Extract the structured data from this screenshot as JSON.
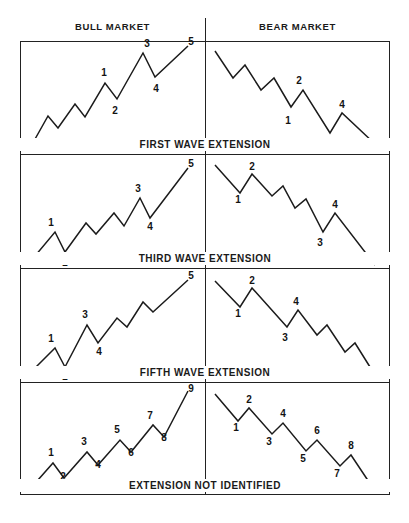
{
  "figure": {
    "title_columns": [
      "BULL MARKET",
      "BEAR MARKET"
    ],
    "header_bull": "BULL MARKET",
    "header_bear": "BEAR MARKET",
    "stroke_color": "#1b1b1b",
    "border_color": "#222222",
    "background": "#ffffff",
    "captions": [
      "FIRST WAVE EXTENSION",
      "THIRD WAVE EXTENSION",
      "FIFTH WAVE EXTENSION",
      "EXTENSION NOT IDENTIFIED"
    ]
  },
  "chart_data": {
    "type": "line",
    "title": "",
    "subtitle": "",
    "xlabel": "",
    "ylabel": "",
    "grid": false,
    "legend": "none",
    "axis_visible": false,
    "panels": [
      {
        "row": 1,
        "column": "bull",
        "caption": "FIRST WAVE EXTENSION",
        "direction": "up",
        "points": [
          [
            30,
            148
          ],
          [
            48,
            116
          ],
          [
            58,
            128
          ],
          [
            75,
            104
          ],
          [
            85,
            117
          ],
          [
            105,
            83
          ],
          [
            117,
            99
          ],
          [
            143,
            53
          ],
          [
            155,
            77
          ],
          [
            188,
            46
          ]
        ],
        "labels": [
          {
            "text": "1",
            "x": 104,
            "y": 76
          },
          {
            "text": "2",
            "x": 115,
            "y": 114
          },
          {
            "text": "3",
            "x": 147,
            "y": 47
          },
          {
            "text": "4",
            "x": 156,
            "y": 92
          },
          {
            "text": "5",
            "x": 191,
            "y": 45
          }
        ]
      },
      {
        "row": 1,
        "column": "bear",
        "caption": "FIRST WAVE EXTENSION",
        "direction": "down",
        "points": [
          [
            215,
            51
          ],
          [
            233,
            78
          ],
          [
            245,
            65
          ],
          [
            261,
            90
          ],
          [
            274,
            78
          ],
          [
            291,
            107
          ],
          [
            303,
            90
          ],
          [
            330,
            133
          ],
          [
            342,
            113
          ],
          [
            375,
            144
          ]
        ],
        "labels": [
          {
            "text": "2",
            "x": 299,
            "y": 84
          },
          {
            "text": "1",
            "x": 288,
            "y": 124
          },
          {
            "text": "4",
            "x": 342,
            "y": 108
          },
          {
            "text": "3",
            "x": 327,
            "y": 146
          },
          {
            "text": "5",
            "x": 378,
            "y": 146
          }
        ]
      },
      {
        "row": 2,
        "column": "bull",
        "caption": "THIRD WAVE EXTENSION",
        "direction": "up",
        "points": [
          [
            30,
            262
          ],
          [
            55,
            232
          ],
          [
            65,
            252
          ],
          [
            86,
            223
          ],
          [
            96,
            234
          ],
          [
            114,
            213
          ],
          [
            124,
            226
          ],
          [
            140,
            198
          ],
          [
            150,
            218
          ],
          [
            188,
            168
          ]
        ],
        "labels": [
          {
            "text": "1",
            "x": 51,
            "y": 226
          },
          {
            "text": "2",
            "x": 65,
            "y": 266
          },
          {
            "text": "3",
            "x": 138,
            "y": 192
          },
          {
            "text": "4",
            "x": 150,
            "y": 230
          },
          {
            "text": "5",
            "x": 191,
            "y": 167
          }
        ]
      },
      {
        "row": 2,
        "column": "bear",
        "caption": "THIRD WAVE EXTENSION",
        "direction": "down",
        "points": [
          [
            215,
            165
          ],
          [
            240,
            193
          ],
          [
            252,
            174
          ],
          [
            272,
            196
          ],
          [
            283,
            186
          ],
          [
            295,
            208
          ],
          [
            306,
            199
          ],
          [
            323,
            232
          ],
          [
            335,
            213
          ],
          [
            375,
            265
          ]
        ],
        "labels": [
          {
            "text": "2",
            "x": 252,
            "y": 170
          },
          {
            "text": "1",
            "x": 238,
            "y": 203
          },
          {
            "text": "4",
            "x": 335,
            "y": 208
          },
          {
            "text": "3",
            "x": 320,
            "y": 246
          },
          {
            "text": "5",
            "x": 378,
            "y": 265
          }
        ]
      },
      {
        "row": 3,
        "column": "bull",
        "caption": "FIFTH WAVE EXTENSION",
        "direction": "up",
        "points": [
          [
            30,
            373
          ],
          [
            55,
            348
          ],
          [
            65,
            367
          ],
          [
            87,
            325
          ],
          [
            98,
            343
          ],
          [
            117,
            318
          ],
          [
            127,
            327
          ],
          [
            143,
            302
          ],
          [
            153,
            312
          ],
          [
            188,
            280
          ]
        ],
        "labels": [
          {
            "text": "1",
            "x": 51,
            "y": 342
          },
          {
            "text": "2",
            "x": 65,
            "y": 380
          },
          {
            "text": "3",
            "x": 85,
            "y": 318
          },
          {
            "text": "4",
            "x": 99,
            "y": 355
          },
          {
            "text": "5",
            "x": 191,
            "y": 279
          }
        ]
      },
      {
        "row": 3,
        "column": "bear",
        "caption": "FIFTH WAVE EXTENSION",
        "direction": "down",
        "points": [
          [
            215,
            281
          ],
          [
            240,
            307
          ],
          [
            252,
            288
          ],
          [
            287,
            327
          ],
          [
            298,
            310
          ],
          [
            317,
            335
          ],
          [
            327,
            325
          ],
          [
            345,
            352
          ],
          [
            355,
            343
          ],
          [
            375,
            375
          ]
        ],
        "labels": [
          {
            "text": "2",
            "x": 252,
            "y": 284
          },
          {
            "text": "1",
            "x": 238,
            "y": 317
          },
          {
            "text": "4",
            "x": 296,
            "y": 305
          },
          {
            "text": "3",
            "x": 285,
            "y": 341
          },
          {
            "text": "5",
            "x": 378,
            "y": 376
          }
        ]
      },
      {
        "row": 4,
        "column": "bull",
        "caption": "EXTENSION NOT IDENTIFIED",
        "direction": "up",
        "points": [
          [
            30,
            489
          ],
          [
            53,
            463
          ],
          [
            64,
            478
          ],
          [
            87,
            452
          ],
          [
            98,
            465
          ],
          [
            120,
            440
          ],
          [
            131,
            452
          ],
          [
            153,
            425
          ],
          [
            164,
            437
          ],
          [
            188,
            391
          ]
        ],
        "labels": [
          {
            "text": "1",
            "x": 51,
            "y": 456
          },
          {
            "text": "2",
            "x": 63,
            "y": 480
          },
          {
            "text": "3",
            "x": 84,
            "y": 445
          },
          {
            "text": "4",
            "x": 98,
            "y": 468
          },
          {
            "text": "5",
            "x": 117,
            "y": 433
          },
          {
            "text": "6",
            "x": 131,
            "y": 456
          },
          {
            "text": "7",
            "x": 150,
            "y": 419
          },
          {
            "text": "8",
            "x": 164,
            "y": 441
          },
          {
            "text": "9",
            "x": 191,
            "y": 392
          }
        ]
      },
      {
        "row": 4,
        "column": "bear",
        "caption": "EXTENSION NOT IDENTIFIED",
        "direction": "down",
        "points": [
          [
            215,
            394
          ],
          [
            238,
            421
          ],
          [
            249,
            408
          ],
          [
            272,
            434
          ],
          [
            283,
            423
          ],
          [
            306,
            451
          ],
          [
            317,
            440
          ],
          [
            340,
            466
          ],
          [
            351,
            455
          ],
          [
            375,
            491
          ]
        ],
        "labels": [
          {
            "text": "2",
            "x": 249,
            "y": 403
          },
          {
            "text": "1",
            "x": 236,
            "y": 431
          },
          {
            "text": "4",
            "x": 283,
            "y": 417
          },
          {
            "text": "3",
            "x": 269,
            "y": 445
          },
          {
            "text": "6",
            "x": 317,
            "y": 434
          },
          {
            "text": "5",
            "x": 303,
            "y": 462
          },
          {
            "text": "8",
            "x": 351,
            "y": 449
          },
          {
            "text": "7",
            "x": 337,
            "y": 477
          },
          {
            "text": "9",
            "x": 378,
            "y": 492
          }
        ]
      }
    ]
  }
}
